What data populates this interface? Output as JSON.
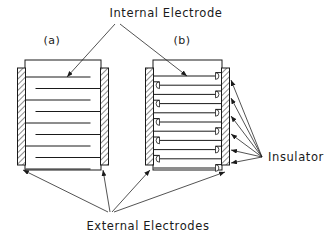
{
  "figure": {
    "type": "line-diagram",
    "background_color": "#ffffff",
    "line_color": "#1a1a1a",
    "labels": {
      "internal_electrode": "Internal Electrode",
      "external_electrodes": "External Electrodes",
      "insulator": "Insulator",
      "panel_a": "(a)",
      "panel_b": "(b)"
    }
  },
  "panels": [
    {
      "id": "a",
      "caption": "(a)",
      "caption_x": 52,
      "caption_y": 44,
      "body": {
        "x": 25,
        "y": 60,
        "width": 76,
        "height": 110
      },
      "external_electrodes": [
        {
          "side": "left",
          "x": 17.5,
          "y": 68,
          "width": 8,
          "height": 97
        },
        {
          "side": "right",
          "x": 100.5,
          "y": 68,
          "width": 8,
          "height": 97
        }
      ],
      "internal_electrodes": {
        "count": 9,
        "first_y": 77,
        "spacing": 11.5,
        "inset": 10,
        "alternating": true,
        "has_insulator_arcs": false
      }
    },
    {
      "id": "b",
      "caption": "(b)",
      "caption_x": 182,
      "caption_y": 44,
      "body": {
        "x": 153,
        "y": 60,
        "width": 69,
        "height": 110
      },
      "external_electrodes": [
        {
          "side": "left",
          "x": 145.5,
          "y": 68,
          "width": 8,
          "height": 97
        },
        {
          "side": "right",
          "x": 221.5,
          "y": 68,
          "width": 8,
          "height": 97
        }
      ],
      "internal_electrodes": {
        "count": 11,
        "first_y": 76,
        "spacing": 9.2,
        "inset": 6,
        "alternating": true,
        "has_insulator_arcs": true
      }
    }
  ],
  "annotations": [
    {
      "name": "internal-electrode",
      "text": "Internal Electrode",
      "text_x": 166,
      "text_y": 17,
      "anchor": "middle",
      "leaders": [
        {
          "from_x": 115,
          "from_y": 24,
          "to_x": 67,
          "to_y": 77
        },
        {
          "from_x": 120,
          "from_y": 24,
          "to_x": 187,
          "to_y": 76
        }
      ]
    },
    {
      "name": "external-electrodes",
      "text": "External Electrodes",
      "text_x": 148,
      "text_y": 230,
      "anchor": "middle",
      "leaders": [
        {
          "from_x": 108,
          "from_y": 212,
          "to_x": 23,
          "to_y": 170
        },
        {
          "from_x": 110,
          "from_y": 212,
          "to_x": 103,
          "to_y": 170
        },
        {
          "from_x": 112,
          "from_y": 212,
          "to_x": 150,
          "to_y": 170
        },
        {
          "from_x": 114,
          "from_y": 212,
          "to_x": 225,
          "to_y": 172
        }
      ]
    },
    {
      "name": "insulator",
      "text": "Insulator",
      "text_x": 268,
      "text_y": 161,
      "anchor": "start",
      "leaders": [
        {
          "from_x": 262,
          "from_y": 157,
          "to_x": 231,
          "to_y": 80
        },
        {
          "from_x": 262,
          "from_y": 157,
          "to_x": 231,
          "to_y": 98
        },
        {
          "from_x": 262,
          "from_y": 157,
          "to_x": 231,
          "to_y": 116
        },
        {
          "from_x": 262,
          "from_y": 157,
          "to_x": 231,
          "to_y": 134
        },
        {
          "from_x": 262,
          "from_y": 157,
          "to_x": 231,
          "to_y": 150
        },
        {
          "from_x": 262,
          "from_y": 157,
          "to_x": 231,
          "to_y": 163
        }
      ]
    }
  ]
}
